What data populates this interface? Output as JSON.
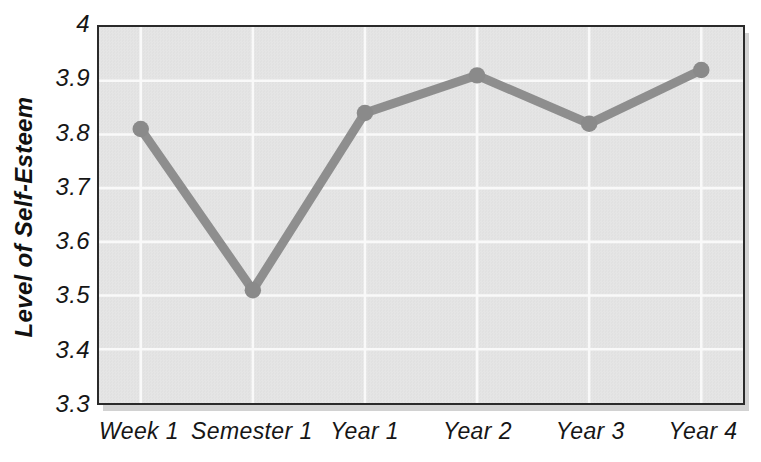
{
  "chart_data": {
    "type": "line",
    "categories": [
      "Week 1",
      "Semester 1",
      "Year 1",
      "Year 2",
      "Year 3",
      "Year 4"
    ],
    "series": [
      {
        "name": "Level of Self-Esteem",
        "values": [
          3.81,
          3.51,
          3.84,
          3.91,
          3.82,
          3.92
        ]
      }
    ],
    "title": "",
    "xlabel": "",
    "ylabel": "Level of Self-Esteem",
    "ylim": [
      3.3,
      4.0
    ],
    "yticks": [
      4.0,
      3.9,
      3.8,
      3.7,
      3.6,
      3.5,
      3.4,
      3.3
    ],
    "ytick_labels": [
      "4",
      "3.9",
      "3.8",
      "3.7",
      "3.6",
      "3.5",
      "3.4",
      "3.3"
    ],
    "grid": true,
    "gridlines": "horizontal-and-vertical",
    "legend": false,
    "marker": "circle",
    "colors": {
      "line": "#8e8e8e",
      "marker": "#8a8a8a",
      "plot_background": "#e3e3e3",
      "gridline": "#f9f9f9",
      "plot_border": "#2a2a2a",
      "shadow": "#d2d2d2",
      "text": "#161616",
      "page_background": "#ffffff"
    }
  }
}
